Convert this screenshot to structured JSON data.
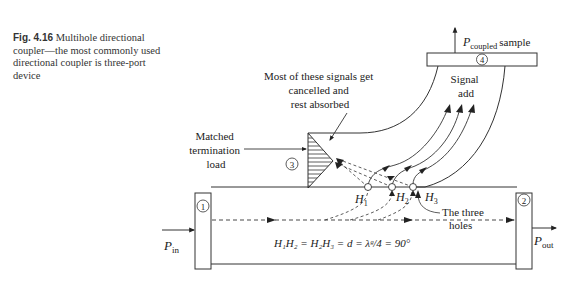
{
  "caption": {
    "figure_label": "Fig. 4.16",
    "text": "Multihole directional coupler—the most commonly used directional coupler is three-port device"
  },
  "diagram": {
    "ports": {
      "port1": "1",
      "port2": "2",
      "port3": "3",
      "port4": "4"
    },
    "labels": {
      "p_in_main": "P",
      "p_in_sub": "in",
      "p_out_main": "P",
      "p_out_sub": "out",
      "p_coupled_main": "P",
      "p_coupled_sub": "coupled",
      "p_coupled_suffix": "sample",
      "cancelled_line1": "Most of these signals get",
      "cancelled_line2": "cancelled and",
      "cancelled_line3": "rest absorbed",
      "signal_add_line1": "Signal",
      "signal_add_line2": "add",
      "matched_line1": "Matched",
      "matched_line2": "termination",
      "matched_line3": "load",
      "holes_line1": "The three",
      "holes_line2": "holes",
      "h1": "H",
      "h1_sub": "1",
      "h2": "H",
      "h2_sub": "2",
      "h3": "H",
      "h3_sub": "3",
      "equation": "H₁H₂ = H₂H₃ = d = λᵍ/4 = 90°"
    }
  }
}
